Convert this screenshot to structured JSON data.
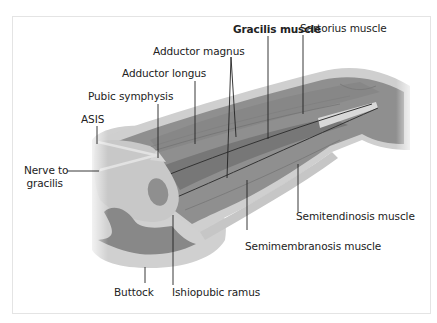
{
  "figure": {
    "colors": {
      "skin": "#d2d2d2",
      "skin_edge": "#bdbdbd",
      "muscle": "#8f8f8f",
      "muscle_dark": "#7a7a7a",
      "bone": "#c4c4c4",
      "tendon": "#d8d8d8",
      "leader": "#222222",
      "label_text": "#222222"
    },
    "labels": {
      "gracilis_muscle": "Gracilis muscle",
      "sartorius_muscle": "Sartorius muscle",
      "adductor_magnus": "Adductor magnus",
      "adductor_longus": "Adductor longus",
      "pubic_symphysis": "Pubic symphysis",
      "asis": "ASIS",
      "nerve_to_gracilis_line1": "Nerve to",
      "nerve_to_gracilis_line2": "gracilis",
      "semitendinosis_muscle": "Semitendinosis muscle",
      "semimembranosis_muscle": "Semimembranosis muscle",
      "buttock": "Buttock",
      "ishiopubic_ramus": "Ishiopubic ramus"
    }
  }
}
